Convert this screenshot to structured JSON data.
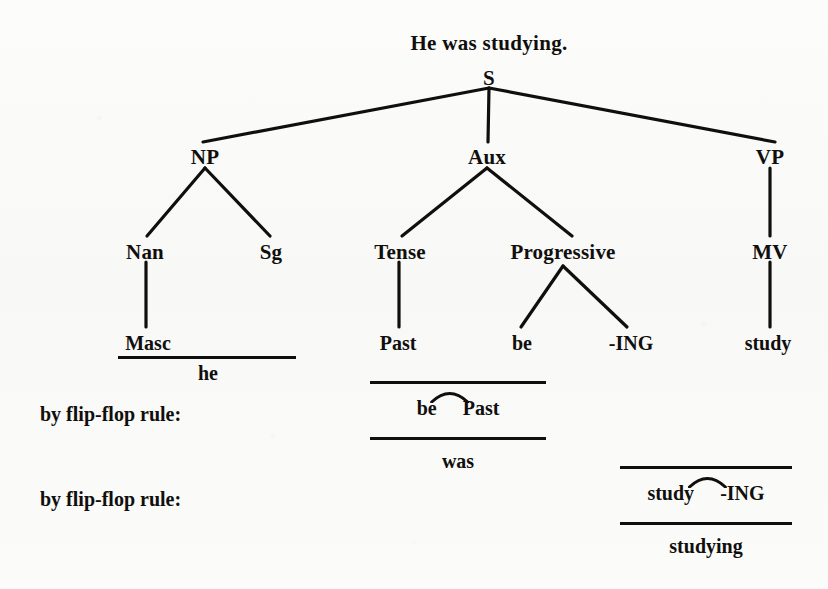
{
  "figure": {
    "sentence": "He was studying.",
    "type": "syntactic-phrase-structure-tree"
  },
  "tree": {
    "root": {
      "label": "S",
      "x": 489,
      "y": 75
    },
    "nodes": [
      {
        "id": "np",
        "label": "NP",
        "x": 205,
        "y": 155
      },
      {
        "id": "aux",
        "label": "Aux",
        "x": 487,
        "y": 155
      },
      {
        "id": "vp",
        "label": "VP",
        "x": 770,
        "y": 155
      },
      {
        "id": "nan",
        "label": "Nan",
        "x": 145,
        "y": 250
      },
      {
        "id": "sg",
        "label": "Sg",
        "x": 271,
        "y": 250
      },
      {
        "id": "tense",
        "label": "Tense",
        "x": 400,
        "y": 250
      },
      {
        "id": "progressive",
        "label": "Progressive",
        "x": 563,
        "y": 250
      },
      {
        "id": "mv",
        "label": "MV",
        "x": 770,
        "y": 250
      }
    ],
    "leaves": [
      {
        "id": "masc",
        "label": "Masc",
        "x": 148,
        "y": 341
      },
      {
        "id": "past",
        "label": "Past",
        "x": 398,
        "y": 341
      },
      {
        "id": "be",
        "label": "be",
        "x": 522,
        "y": 341
      },
      {
        "id": "ing",
        "label": "-ING",
        "x": 631,
        "y": 341
      },
      {
        "id": "study",
        "label": "study",
        "x": 768,
        "y": 341
      }
    ]
  },
  "lexical_insertion": {
    "line": {
      "x": 118,
      "y": 356,
      "width": 178
    },
    "word": {
      "text": "he",
      "x": 208,
      "y": 370
    }
  },
  "derivations": [
    {
      "id": "was",
      "rule_label": "by flip-flop rule:",
      "rule_label_x": 40,
      "rule_label_y": 404,
      "top_line": {
        "x": 370,
        "y": 381,
        "width": 176
      },
      "bottom_line": {
        "x": 370,
        "y": 437,
        "width": 176
      },
      "morph_left": "be",
      "morph_right": "Past",
      "morphs_x": 458,
      "morphs_y": 400,
      "result": "was",
      "result_x": 458,
      "result_y": 451
    },
    {
      "id": "studying",
      "rule_label": "by flip-flop rule:",
      "rule_label_x": 40,
      "rule_label_y": 489,
      "top_line": {
        "x": 620,
        "y": 466,
        "width": 172
      },
      "bottom_line": {
        "x": 620,
        "y": 522,
        "width": 172
      },
      "morph_left": "study",
      "morph_right": "-ING",
      "morphs_x": 706,
      "morphs_y": 485,
      "result": "studying",
      "result_x": 706,
      "result_y": 536
    }
  ],
  "style": {
    "ink": "#100f0d",
    "paper": "#fbfbfa"
  }
}
